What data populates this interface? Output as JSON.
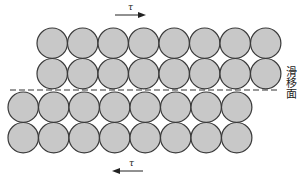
{
  "diagram": {
    "shear_top": {
      "symbol": "τ",
      "direction": "right"
    },
    "shear_bottom": {
      "symbol": "τ",
      "direction": "left"
    },
    "slip_plane_label": "滑移面",
    "upper_block": {
      "rows": 2,
      "atoms_per_row": 8
    },
    "lower_block": {
      "rows": 2,
      "atoms_per_row": 8
    },
    "colors": {
      "atom_fill": "#c8c8c8",
      "atom_stroke": "#3a3a3a",
      "line": "#333333"
    }
  }
}
